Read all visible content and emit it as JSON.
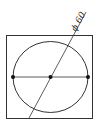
{
  "diagram": {
    "type": "engineering-drawing",
    "dimension_label": "ϕ 60",
    "colors": {
      "stroke": "#333333",
      "background": "#ffffff"
    },
    "square": {
      "x": 6,
      "y": 35,
      "width": 87,
      "height": 84
    },
    "circle": {
      "cx": 51,
      "cy": 77,
      "rx": 38,
      "ry": 36
    },
    "horizontal_line": {
      "x1": 13,
      "y1": 77,
      "x2": 88,
      "y2": 77
    },
    "points": [
      {
        "name": "left-point",
        "x": 13,
        "y": 77
      },
      {
        "name": "center-point",
        "x": 51,
        "y": 77
      },
      {
        "name": "right-point",
        "x": 88,
        "y": 77
      }
    ],
    "dimension_line": {
      "x1": 29,
      "y1": 118,
      "x2": 86,
      "y2": 12
    }
  }
}
